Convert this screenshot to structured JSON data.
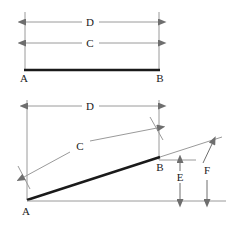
{
  "figure": {
    "background_color": "#ffffff",
    "colors": {
      "heavy_line": "#1a1a1a",
      "thin_line": "#8c8c8c",
      "label_text": "#1a1a1a"
    },
    "panels": [
      {
        "name": "upper-panel",
        "description": "Level baseline from A to B with two equal dimension arrows D and C above it",
        "labels": {
          "vertex_left": "A",
          "vertex_right": "B",
          "dimension_outer": "D",
          "dimension_inner": "C"
        }
      },
      {
        "name": "lower-panel",
        "description": "Inclined line from A rising to B, with horizontal dimension D, slope-parallel dimension C, and vertical height dimensions E and F",
        "labels": {
          "vertex_left": "A",
          "vertex_right": "B",
          "dimension_horizontal": "D",
          "dimension_slope": "C",
          "dimension_height_inner": "E",
          "dimension_height_outer": "F"
        }
      }
    ],
    "legend_letters": [
      "A",
      "B",
      "C",
      "D",
      "E",
      "F"
    ]
  }
}
